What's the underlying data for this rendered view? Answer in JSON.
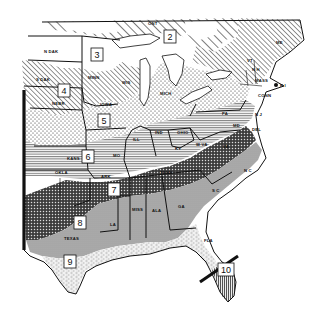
{
  "map": {
    "subject": "Plant hardiness zone map — eastern and central United States",
    "style": "black-and-white hatched/stippled zones",
    "zones": [
      {
        "id": "2",
        "label": "2",
        "pattern": "wide diagonal hatch",
        "x": 170,
        "y": 37
      },
      {
        "id": "3",
        "label": "3",
        "pattern": "white / light",
        "x": 97,
        "y": 55
      },
      {
        "id": "4",
        "label": "4",
        "pattern": "diagonal hatch",
        "x": 64,
        "y": 91
      },
      {
        "id": "5",
        "label": "5",
        "pattern": "light stipple",
        "x": 104,
        "y": 121
      },
      {
        "id": "6",
        "label": "6",
        "pattern": "horizontal lines",
        "x": 88,
        "y": 157
      },
      {
        "id": "7",
        "label": "7",
        "pattern": "dense crosshatch / dots",
        "x": 114,
        "y": 190
      },
      {
        "id": "8",
        "label": "8",
        "pattern": "gray shading",
        "x": 80,
        "y": 223
      },
      {
        "id": "9",
        "label": "9",
        "pattern": "fine dashes / stipple",
        "x": 70,
        "y": 262
      },
      {
        "id": "10",
        "label": "10",
        "pattern": "vertical lines",
        "x": 226,
        "y": 270
      }
    ],
    "state_labels": [
      {
        "name": "N DAK",
        "x": 44,
        "y": 53
      },
      {
        "name": "S DAK",
        "x": 36,
        "y": 81
      },
      {
        "name": "NEBR",
        "x": 52,
        "y": 105
      },
      {
        "name": "KANS",
        "x": 67,
        "y": 160
      },
      {
        "name": "OKLA",
        "x": 55,
        "y": 174
      },
      {
        "name": "TEXAS",
        "x": 64,
        "y": 240
      },
      {
        "name": "MINN",
        "x": 88,
        "y": 79
      },
      {
        "name": "IOWA",
        "x": 100,
        "y": 106
      },
      {
        "name": "WIS",
        "x": 122,
        "y": 84
      },
      {
        "name": "MO",
        "x": 113,
        "y": 157
      },
      {
        "name": "ARK",
        "x": 101,
        "y": 178
      },
      {
        "name": "LA",
        "x": 110,
        "y": 226
      },
      {
        "name": "MISS",
        "x": 132,
        "y": 211
      },
      {
        "name": "ALA",
        "x": 157,
        "y": 212
      },
      {
        "name": "GA",
        "x": 181,
        "y": 208
      },
      {
        "name": "FLA",
        "x": 209,
        "y": 242
      },
      {
        "name": "ILL",
        "x": 133,
        "y": 141
      },
      {
        "name": "IND",
        "x": 157,
        "y": 134
      },
      {
        "name": "OHIO",
        "x": 181,
        "y": 134
      },
      {
        "name": "MICH",
        "x": 163,
        "y": 95
      },
      {
        "name": "KY",
        "x": 177,
        "y": 150
      },
      {
        "name": "TENN",
        "x": 163,
        "y": 174
      },
      {
        "name": "W VA",
        "x": 199,
        "y": 146
      },
      {
        "name": "VA",
        "x": 225,
        "y": 148
      },
      {
        "name": "N C",
        "x": 247,
        "y": 172
      },
      {
        "name": "S C",
        "x": 215,
        "y": 192
      },
      {
        "name": "PA",
        "x": 224,
        "y": 115
      },
      {
        "name": "MD",
        "x": 235,
        "y": 127
      },
      {
        "name": "DEL",
        "x": 254,
        "y": 130
      },
      {
        "name": "N J",
        "x": 256,
        "y": 116
      },
      {
        "name": "CONN",
        "x": 260,
        "y": 97
      },
      {
        "name": "MASS",
        "x": 258,
        "y": 82
      },
      {
        "name": "R I",
        "x": 280,
        "y": 85
      },
      {
        "name": "N H",
        "x": 254,
        "y": 71
      },
      {
        "name": "VT",
        "x": 249,
        "y": 62
      },
      {
        "name": "ME",
        "x": 277,
        "y": 44
      },
      {
        "name": "ONT",
        "x": 150,
        "y": 24
      }
    ],
    "colors": {
      "ink": "#111111",
      "paper": "#ffffff",
      "zone8_gray": "#a9a9a9",
      "zone7_dark": "#3c3c3c"
    }
  }
}
